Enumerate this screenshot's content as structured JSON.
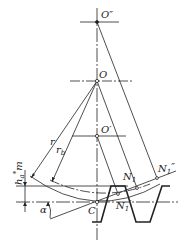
{
  "labels": {
    "O_double_prime": "O″",
    "O": "O",
    "O_prime": "O′",
    "C": "C",
    "r": "r",
    "rb": "r",
    "rb_sub": "b",
    "N1": "N",
    "N1_sub": "1",
    "N1_prime": "N",
    "N1_prime_sub": "1",
    "N1_prime_mark": "′",
    "N1_double": "N",
    "N1_double_sub": "1",
    "N1_double_mark": "″",
    "ham": "h",
    "ham_sup": "*",
    "ham_sub": "a",
    "ham_m": "m",
    "alpha": "α"
  },
  "colors": {
    "line": "#222222",
    "background": "#ffffff"
  }
}
